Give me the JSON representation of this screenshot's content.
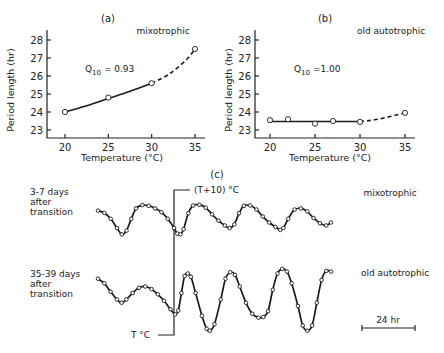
{
  "chart_data": [
    {
      "type": "line",
      "panel": "(a)",
      "condition": "mixotrophic",
      "annotation": "Q10 = 0.93",
      "annotation_main": "Q",
      "annotation_sub": "10",
      "annotation_rest": " = 0.93",
      "xlabel": "Temperature (°C)",
      "ylabel": "Period length (hr)",
      "xlim": [
        18,
        37
      ],
      "ylim": [
        22.5,
        28.5
      ],
      "xticks": [
        20,
        25,
        30,
        35
      ],
      "yticks": [
        23,
        24,
        25,
        26,
        27,
        28
      ],
      "points": [
        {
          "x": 20,
          "y": 24.0
        },
        {
          "x": 25,
          "y": 24.8
        },
        {
          "x": 30,
          "y": 25.6
        },
        {
          "x": 35,
          "y": 27.5
        }
      ],
      "fit_solid": [
        [
          20,
          24.0
        ],
        [
          22.5,
          24.35
        ],
        [
          25,
          24.75
        ],
        [
          27.5,
          25.15
        ],
        [
          30,
          25.6
        ]
      ],
      "fit_dashed": [
        [
          30,
          25.6
        ],
        [
          32,
          26.1
        ],
        [
          34,
          26.9
        ],
        [
          35,
          27.5
        ]
      ]
    },
    {
      "type": "line",
      "panel": "(b)",
      "condition": "old autotrophic",
      "annotation": "Q10 = 1.00",
      "annotation_main": "Q",
      "annotation_sub": "10",
      "annotation_rest": " =1.00",
      "xlabel": "Temperature (°C)",
      "ylabel": "Period length (hr)",
      "xlim": [
        18,
        37
      ],
      "ylim": [
        22.5,
        28.5
      ],
      "xticks": [
        20,
        25,
        30,
        35
      ],
      "yticks": [
        23,
        24,
        25,
        26,
        27,
        28
      ],
      "points": [
        {
          "x": 20,
          "y": 23.55
        },
        {
          "x": 22,
          "y": 23.6
        },
        {
          "x": 25,
          "y": 23.35
        },
        {
          "x": 27,
          "y": 23.5
        },
        {
          "x": 30,
          "y": 23.45
        },
        {
          "x": 35,
          "y": 23.95
        }
      ],
      "fit_solid": [
        [
          20,
          23.47
        ],
        [
          30,
          23.47
        ]
      ],
      "fit_dashed": [
        [
          30,
          23.47
        ],
        [
          32,
          23.6
        ],
        [
          35,
          23.95
        ]
      ]
    },
    {
      "type": "line",
      "panel": "(c)",
      "title": "(c)",
      "step_label_high": "(T+10) °C",
      "step_label_low": "T °C",
      "scale_bar": "24 hr",
      "time_unit_hours_per_bar": 24,
      "series": [
        {
          "name": "3-7 days after transition",
          "label_lines": [
            "3-7 days",
            "after",
            "transition"
          ],
          "condition": "mixotrophic",
          "note": "relative oscillation traces (arbitrary units); x in hours from trace start, y relative amplitude 0-1 (1 = top)",
          "trace": [
            [
              0,
              0.82
            ],
            [
              4,
              0.76
            ],
            [
              8,
              0.6
            ],
            [
              12,
              0.35
            ],
            [
              15,
              0.18
            ],
            [
              18,
              0.28
            ],
            [
              21,
              0.6
            ],
            [
              24,
              0.88
            ],
            [
              28,
              0.97
            ],
            [
              32,
              0.95
            ],
            [
              36,
              0.88
            ],
            [
              40,
              0.78
            ],
            [
              44,
              0.6
            ],
            [
              48,
              0.35
            ],
            [
              50,
              0.2
            ],
            [
              52,
              0.18
            ],
            [
              54,
              0.32
            ],
            [
              57,
              0.75
            ],
            [
              60,
              0.96
            ],
            [
              64,
              0.98
            ],
            [
              68,
              0.9
            ],
            [
              72,
              0.72
            ],
            [
              76,
              0.55
            ],
            [
              80,
              0.42
            ],
            [
              83,
              0.35
            ],
            [
              86,
              0.45
            ],
            [
              89,
              0.75
            ],
            [
              92,
              0.95
            ],
            [
              96,
              0.96
            ],
            [
              100,
              0.85
            ],
            [
              104,
              0.66
            ],
            [
              108,
              0.5
            ],
            [
              112,
              0.38
            ],
            [
              115,
              0.3
            ],
            [
              117,
              0.35
            ],
            [
              120,
              0.6
            ],
            [
              124,
              0.85
            ],
            [
              128,
              0.88
            ],
            [
              132,
              0.8
            ],
            [
              136,
              0.62
            ],
            [
              140,
              0.48
            ],
            [
              144,
              0.42
            ],
            [
              147,
              0.5
            ]
          ]
        },
        {
          "name": "35-39 days after transition",
          "label_lines": [
            "35-39 days",
            "after",
            "transition"
          ],
          "condition": "old autotrophic",
          "note": "relative oscillation traces (arbitrary units); x in hours from trace start, y relative amplitude 0-1 (1 = top)",
          "trace": [
            [
              0,
              0.82
            ],
            [
              4,
              0.75
            ],
            [
              8,
              0.62
            ],
            [
              12,
              0.5
            ],
            [
              15,
              0.45
            ],
            [
              18,
              0.5
            ],
            [
              22,
              0.6
            ],
            [
              26,
              0.68
            ],
            [
              30,
              0.7
            ],
            [
              34,
              0.66
            ],
            [
              38,
              0.58
            ],
            [
              42,
              0.48
            ],
            [
              46,
              0.35
            ],
            [
              49,
              0.27
            ],
            [
              51,
              0.33
            ],
            [
              53,
              0.6
            ],
            [
              55,
              0.86
            ],
            [
              57,
              0.9
            ],
            [
              59,
              0.85
            ],
            [
              62,
              0.6
            ],
            [
              66,
              0.25
            ],
            [
              69,
              0.05
            ],
            [
              71,
              0.02
            ],
            [
              74,
              0.12
            ],
            [
              78,
              0.5
            ],
            [
              81,
              0.82
            ],
            [
              84,
              0.92
            ],
            [
              87,
              0.88
            ],
            [
              90,
              0.7
            ],
            [
              94,
              0.45
            ],
            [
              98,
              0.28
            ],
            [
              102,
              0.22
            ],
            [
              105,
              0.23
            ],
            [
              108,
              0.32
            ],
            [
              111,
              0.65
            ],
            [
              114,
              0.9
            ],
            [
              117,
              0.97
            ],
            [
              120,
              0.93
            ],
            [
              123,
              0.75
            ],
            [
              127,
              0.4
            ],
            [
              130,
              0.1
            ],
            [
              133,
              0.02
            ],
            [
              136,
              0.1
            ],
            [
              139,
              0.45
            ],
            [
              142,
              0.8
            ],
            [
              145,
              0.94
            ],
            [
              148,
              0.93
            ]
          ]
        }
      ]
    }
  ]
}
